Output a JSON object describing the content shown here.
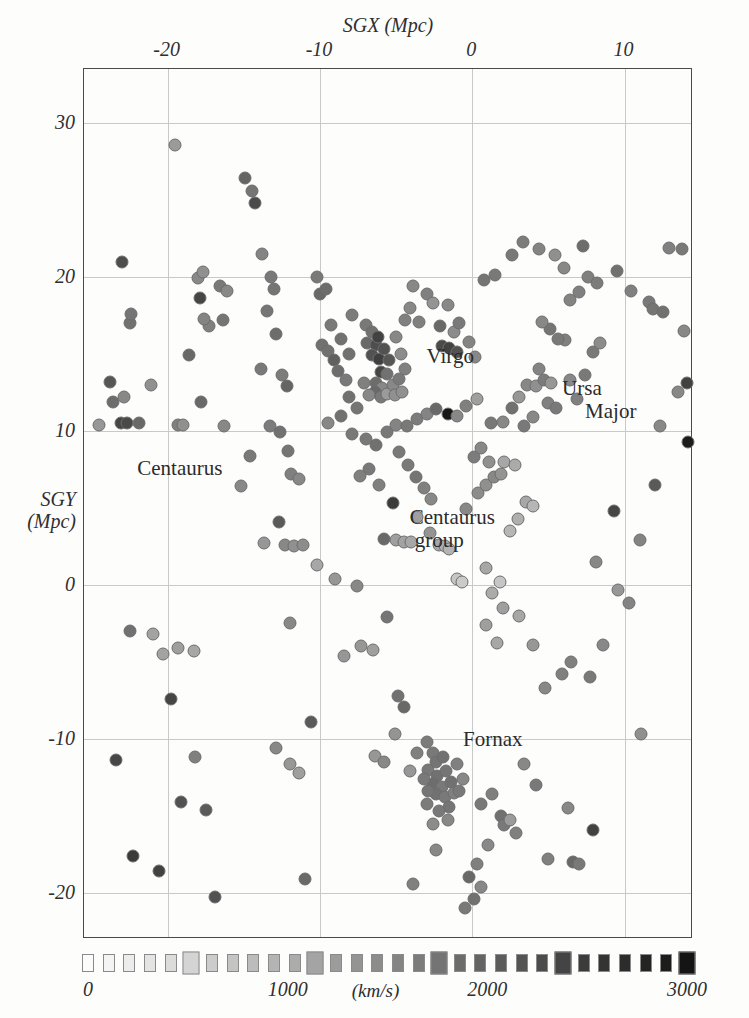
{
  "figure": {
    "caption_none": "",
    "background": "#fdfdfc"
  },
  "chart_data": {
    "type": "scatter",
    "title": "",
    "xlabel": "SGX (Mpc)",
    "ylabel_line1": "SGY",
    "ylabel_line2": "(Mpc)",
    "xlim": [
      -25.5,
      14.5
    ],
    "ylim": [
      -23.0,
      33.5
    ],
    "xticks": [
      -20,
      -10,
      0,
      10
    ],
    "xticklabels": [
      "-20",
      "-10",
      "0",
      "10"
    ],
    "yticks": [
      30,
      20,
      10,
      0,
      -10,
      -20
    ],
    "yticklabels": [
      "30",
      "20",
      "10",
      "0",
      "-10",
      "-20"
    ],
    "grid": true,
    "grid_color": "#c9c9c9",
    "marker": "circle",
    "marker_edge_color": "#6d6d6d",
    "colorbar": {
      "label": "(km/s)",
      "vmin": 0,
      "vmax": 3000,
      "ticks": [
        0,
        1000,
        2000,
        3000
      ],
      "ticklabels": [
        "0",
        "1000",
        "2000",
        "3000"
      ],
      "n_swatches": 30,
      "swatch_shape": "square",
      "low_color": "#ffffff",
      "high_color": "#1a1a1a",
      "position": "below-axes"
    },
    "annotations": [
      {
        "text": "Virgo",
        "x": -3.0,
        "y": 15.6,
        "lines": [
          "Virgo"
        ]
      },
      {
        "text": "Ursa Major",
        "x": 5.9,
        "y": 13.5,
        "lines": [
          "Ursa",
          "Major"
        ]
      },
      {
        "text": "Centaurus",
        "x": -22.0,
        "y": 8.3,
        "lines": [
          "Centaurus"
        ]
      },
      {
        "text": "Centaurus group",
        "x": -4.1,
        "y": 5.1,
        "lines": [
          "Centaurus",
          "group"
        ]
      },
      {
        "text": "Fornax",
        "x": -0.6,
        "y": -9.3,
        "lines": [
          "Fornax"
        ]
      }
    ],
    "point_fields": [
      "sgx_mpc",
      "sgy_mpc",
      "velocity_kms"
    ],
    "points": [
      [
        -23.8,
        13.2,
        2150
      ],
      [
        -23.6,
        11.9,
        1850
      ],
      [
        -22.9,
        12.2,
        1500
      ],
      [
        -24.5,
        10.4,
        1300
      ],
      [
        -23.1,
        10.5,
        2350
      ],
      [
        -22.7,
        10.5,
        2300
      ],
      [
        -21.9,
        10.5,
        1900
      ],
      [
        -22.5,
        17.0,
        1800
      ],
      [
        -23.0,
        21.0,
        2250
      ],
      [
        -21.1,
        13.0,
        1400
      ],
      [
        -22.4,
        17.6,
        1750
      ],
      [
        -19.5,
        28.6,
        1250
      ],
      [
        -22.5,
        -3.0,
        1800
      ],
      [
        -21.0,
        -3.2,
        1150
      ],
      [
        -23.4,
        -11.4,
        2350
      ],
      [
        -22.3,
        -17.6,
        2500
      ],
      [
        -20.6,
        -18.6,
        2400
      ],
      [
        -19.8,
        -7.4,
        2350
      ],
      [
        -19.3,
        10.4,
        1600
      ],
      [
        -18.0,
        19.9,
        1500
      ],
      [
        -17.7,
        20.3,
        1400
      ],
      [
        -17.9,
        18.6,
        2350
      ],
      [
        -17.3,
        16.8,
        1600
      ],
      [
        -17.6,
        17.3,
        1550
      ],
      [
        -16.6,
        19.4,
        1700
      ],
      [
        -16.1,
        19.1,
        1500
      ],
      [
        -16.4,
        17.2,
        1750
      ],
      [
        -18.6,
        14.9,
        1900
      ],
      [
        -17.8,
        11.9,
        1900
      ],
      [
        -19.0,
        10.4,
        1400
      ],
      [
        -16.3,
        10.3,
        1500
      ],
      [
        -18.3,
        -4.3,
        1100
      ],
      [
        -19.3,
        -4.1,
        1200
      ],
      [
        -20.3,
        -4.5,
        1150
      ],
      [
        -18.2,
        -11.2,
        1600
      ],
      [
        -17.5,
        -14.6,
        2100
      ],
      [
        -19.1,
        -14.1,
        2200
      ],
      [
        -16.9,
        -20.3,
        2200
      ],
      [
        -14.9,
        26.4,
        1950
      ],
      [
        -14.5,
        25.6,
        1750
      ],
      [
        -14.3,
        24.8,
        2300
      ],
      [
        -13.8,
        21.5,
        1550
      ],
      [
        -13.2,
        20.0,
        1700
      ],
      [
        -13.0,
        19.2,
        1750
      ],
      [
        -13.5,
        17.8,
        1750
      ],
      [
        -12.9,
        16.3,
        1850
      ],
      [
        -13.9,
        14.0,
        1700
      ],
      [
        -12.5,
        13.6,
        1650
      ],
      [
        -12.2,
        12.9,
        1950
      ],
      [
        -13.3,
        10.3,
        1650
      ],
      [
        -12.6,
        9.9,
        1800
      ],
      [
        -12.1,
        8.7,
        1750
      ],
      [
        -11.9,
        7.2,
        1600
      ],
      [
        -11.4,
        6.9,
        1500
      ],
      [
        -12.7,
        4.1,
        2100
      ],
      [
        -12.3,
        2.6,
        1500
      ],
      [
        -11.7,
        2.5,
        1400
      ],
      [
        -11.1,
        2.6,
        1450
      ],
      [
        -12.9,
        -10.6,
        1500
      ],
      [
        -12.0,
        -11.6,
        1300
      ],
      [
        -11.4,
        -12.2,
        1200
      ],
      [
        -10.6,
        -8.9,
        2100
      ],
      [
        -11.0,
        -19.1,
        1900
      ],
      [
        -10.2,
        20.0,
        1700
      ],
      [
        -10.0,
        18.9,
        1900
      ],
      [
        -9.6,
        19.2,
        1850
      ],
      [
        -9.3,
        16.9,
        1700
      ],
      [
        -9.9,
        15.6,
        1800
      ],
      [
        -9.5,
        15.2,
        1800
      ],
      [
        -9.1,
        14.6,
        2000
      ],
      [
        -8.6,
        16.0,
        1800
      ],
      [
        -8.1,
        15.0,
        1800
      ],
      [
        -8.8,
        13.9,
        1850
      ],
      [
        -8.3,
        13.3,
        1700
      ],
      [
        -8.1,
        12.2,
        1800
      ],
      [
        -7.6,
        11.5,
        1750
      ],
      [
        -7.9,
        17.5,
        1650
      ],
      [
        -7.0,
        16.9,
        1700
      ],
      [
        -6.9,
        15.7,
        1900
      ],
      [
        -6.6,
        16.4,
        1800
      ],
      [
        -6.3,
        15.6,
        2250
      ],
      [
        -6.2,
        16.1,
        2400
      ],
      [
        -6.6,
        14.9,
        2200
      ],
      [
        -6.1,
        14.7,
        2450
      ],
      [
        -5.8,
        15.3,
        2200
      ],
      [
        -5.5,
        14.6,
        2150
      ],
      [
        -6.0,
        13.8,
        2350
      ],
      [
        -5.6,
        13.7,
        1800
      ],
      [
        -6.3,
        13.1,
        1850
      ],
      [
        -5.9,
        12.8,
        1500
      ],
      [
        -6.4,
        12.5,
        1900
      ],
      [
        -6.0,
        12.2,
        1700
      ],
      [
        -5.6,
        12.4,
        1250
      ],
      [
        -5.2,
        13.0,
        1500
      ],
      [
        -4.8,
        13.4,
        1700
      ],
      [
        -5.1,
        12.3,
        1400
      ],
      [
        -4.6,
        12.5,
        1400
      ],
      [
        -6.8,
        12.3,
        1500
      ],
      [
        -7.1,
        13.1,
        1600
      ],
      [
        -4.4,
        14.0,
        1600
      ],
      [
        -4.7,
        15.0,
        1450
      ],
      [
        -5.0,
        16.1,
        1500
      ],
      [
        -4.4,
        17.2,
        1600
      ],
      [
        -4.1,
        18.0,
        1500
      ],
      [
        -3.9,
        19.4,
        1500
      ],
      [
        -3.5,
        17.1,
        1600
      ],
      [
        -3.0,
        18.9,
        1600
      ],
      [
        -2.6,
        18.3,
        1350
      ],
      [
        -2.1,
        16.8,
        1900
      ],
      [
        -1.6,
        18.2,
        1500
      ],
      [
        -1.2,
        16.4,
        1450
      ],
      [
        -2.0,
        15.5,
        2300
      ],
      [
        -1.5,
        15.4,
        2400
      ],
      [
        -1.0,
        15.1,
        2200
      ],
      [
        -0.9,
        17.0,
        1700
      ],
      [
        -0.2,
        15.8,
        1550
      ],
      [
        0.2,
        14.8,
        1500
      ],
      [
        -8.6,
        11.0,
        1800
      ],
      [
        -9.5,
        10.5,
        1500
      ],
      [
        -7.9,
        9.8,
        1700
      ],
      [
        -7.0,
        9.5,
        1700
      ],
      [
        -6.3,
        9.1,
        1800
      ],
      [
        -5.6,
        9.9,
        1700
      ],
      [
        -5.0,
        10.4,
        1550
      ],
      [
        -4.3,
        10.3,
        1700
      ],
      [
        -3.6,
        10.8,
        1650
      ],
      [
        -3.0,
        11.1,
        1550
      ],
      [
        -2.4,
        11.4,
        1900
      ],
      [
        -1.6,
        11.1,
        2950
      ],
      [
        -1.0,
        11.0,
        1500
      ],
      [
        -0.4,
        11.6,
        1600
      ],
      [
        0.3,
        12.1,
        1200
      ],
      [
        -4.8,
        8.6,
        1700
      ],
      [
        -4.2,
        7.8,
        1700
      ],
      [
        -3.7,
        7.0,
        1750
      ],
      [
        -3.2,
        6.3,
        1600
      ],
      [
        -2.7,
        5.6,
        1500
      ],
      [
        -3.6,
        4.4,
        1200
      ],
      [
        -2.8,
        3.4,
        1350
      ],
      [
        -2.2,
        2.6,
        1100
      ],
      [
        -1.8,
        2.5,
        1000
      ],
      [
        -1.5,
        2.3,
        950
      ],
      [
        -1.0,
        0.4,
        700
      ],
      [
        -0.7,
        0.2,
        650
      ],
      [
        -5.2,
        5.3,
        2500
      ],
      [
        -6.1,
        6.5,
        1600
      ],
      [
        -6.8,
        7.5,
        1700
      ],
      [
        -7.4,
        7.1,
        1600
      ],
      [
        -5.8,
        3.0,
        1900
      ],
      [
        -5.0,
        2.9,
        1200
      ],
      [
        -4.5,
        2.8,
        1150
      ],
      [
        -4.0,
        2.8,
        1100
      ],
      [
        -0.4,
        4.9,
        1500
      ],
      [
        0.4,
        6.0,
        1450
      ],
      [
        0.9,
        6.5,
        1400
      ],
      [
        1.4,
        7.0,
        1500
      ],
      [
        1.9,
        7.2,
        1350
      ],
      [
        0.1,
        8.3,
        1650
      ],
      [
        0.6,
        8.9,
        1500
      ],
      [
        1.1,
        8.0,
        1400
      ],
      [
        2.1,
        8.0,
        1100
      ],
      [
        2.8,
        7.8,
        1050
      ],
      [
        0.9,
        1.1,
        1100
      ],
      [
        1.8,
        0.2,
        700
      ],
      [
        2.5,
        3.5,
        900
      ],
      [
        3.0,
        4.3,
        1000
      ],
      [
        3.5,
        5.4,
        1100
      ],
      [
        4.0,
        5.1,
        900
      ],
      [
        1.2,
        10.5,
        1700
      ],
      [
        2.0,
        10.6,
        1500
      ],
      [
        2.6,
        11.5,
        1800
      ],
      [
        3.1,
        12.2,
        1300
      ],
      [
        3.6,
        13.0,
        1500
      ],
      [
        4.2,
        12.9,
        1400
      ],
      [
        4.7,
        13.3,
        1650
      ],
      [
        5.2,
        13.1,
        1300
      ],
      [
        4.4,
        14.0,
        1550
      ],
      [
        5.0,
        11.8,
        1600
      ],
      [
        5.5,
        11.5,
        1700
      ],
      [
        4.0,
        10.9,
        1500
      ],
      [
        3.4,
        10.3,
        1700
      ],
      [
        6.4,
        13.3,
        1500
      ],
      [
        6.9,
        12.1,
        1600
      ],
      [
        7.4,
        13.6,
        1700
      ],
      [
        7.9,
        15.1,
        1700
      ],
      [
        8.4,
        15.7,
        1450
      ],
      [
        6.1,
        15.9,
        1600
      ],
      [
        5.6,
        16.0,
        1700
      ],
      [
        5.1,
        16.6,
        1750
      ],
      [
        4.6,
        17.1,
        1500
      ],
      [
        6.4,
        18.5,
        1550
      ],
      [
        7.0,
        19.0,
        1600
      ],
      [
        7.6,
        20.0,
        1600
      ],
      [
        8.2,
        19.6,
        1650
      ],
      [
        6.0,
        20.6,
        1500
      ],
      [
        5.4,
        21.4,
        1400
      ],
      [
        4.4,
        21.8,
        1550
      ],
      [
        3.3,
        22.3,
        1650
      ],
      [
        2.6,
        21.4,
        1700
      ],
      [
        1.5,
        20.1,
        1700
      ],
      [
        0.8,
        19.8,
        1750
      ],
      [
        7.3,
        22.0,
        1850
      ],
      [
        9.5,
        20.4,
        1800
      ],
      [
        10.4,
        19.1,
        1600
      ],
      [
        11.6,
        18.4,
        1700
      ],
      [
        11.9,
        17.9,
        1750
      ],
      [
        12.5,
        17.7,
        1800
      ],
      [
        12.9,
        21.9,
        1600
      ],
      [
        13.8,
        21.8,
        1700
      ],
      [
        13.9,
        16.5,
        1500
      ],
      [
        13.5,
        12.5,
        1500
      ],
      [
        14.1,
        13.1,
        2400
      ],
      [
        14.2,
        9.3,
        2900
      ],
      [
        12.3,
        10.3,
        1500
      ],
      [
        12.0,
        6.5,
        2100
      ],
      [
        11.0,
        2.9,
        1550
      ],
      [
        10.3,
        -1.2,
        1550
      ],
      [
        9.6,
        -0.3,
        1300
      ],
      [
        11.1,
        -9.7,
        1400
      ],
      [
        8.6,
        -3.9,
        1500
      ],
      [
        7.7,
        -6.0,
        1700
      ],
      [
        6.5,
        -5.0,
        1600
      ],
      [
        5.9,
        -5.8,
        1600
      ],
      [
        4.8,
        -6.7,
        1500
      ],
      [
        4.0,
        -3.9,
        1300
      ],
      [
        3.1,
        -2.0,
        1100
      ],
      [
        2.0,
        -1.5,
        1200
      ],
      [
        1.3,
        -0.5,
        1050
      ],
      [
        -6.5,
        -4.2,
        1200
      ],
      [
        -7.3,
        -4.0,
        1300
      ],
      [
        -8.4,
        -4.6,
        1300
      ],
      [
        -5.6,
        -2.1,
        1750
      ],
      [
        -6.4,
        -11.1,
        1300
      ],
      [
        -5.8,
        -11.5,
        1500
      ],
      [
        -5.1,
        -9.7,
        1350
      ],
      [
        -4.5,
        -7.9,
        1900
      ],
      [
        -4.9,
        -7.2,
        1800
      ],
      [
        -3.6,
        -10.9,
        1600
      ],
      [
        -4.1,
        -12.1,
        1300
      ],
      [
        -3.0,
        -10.2,
        1650
      ],
      [
        -2.6,
        -10.9,
        1700
      ],
      [
        -2.4,
        -11.5,
        1750
      ],
      [
        -1.9,
        -11.2,
        1800
      ],
      [
        -2.9,
        -12.0,
        1700
      ],
      [
        -2.3,
        -12.4,
        1800
      ],
      [
        -1.7,
        -12.1,
        1750
      ],
      [
        -2.6,
        -12.9,
        1850
      ],
      [
        -2.0,
        -13.1,
        1700
      ],
      [
        -1.4,
        -12.8,
        1800
      ],
      [
        -2.4,
        -13.6,
        1800
      ],
      [
        -1.8,
        -13.8,
        1700
      ],
      [
        -1.2,
        -13.5,
        1600
      ],
      [
        -2.9,
        -13.4,
        1750
      ],
      [
        -3.2,
        -12.6,
        1700
      ],
      [
        -1.5,
        -14.4,
        1750
      ],
      [
        -2.2,
        -14.7,
        1700
      ],
      [
        -3.0,
        -14.2,
        1650
      ],
      [
        -1.0,
        -11.6,
        1600
      ],
      [
        -0.6,
        -12.6,
        1500
      ],
      [
        -0.9,
        -13.4,
        1700
      ],
      [
        -1.6,
        -15.3,
        1500
      ],
      [
        -2.6,
        -15.5,
        1450
      ],
      [
        0.6,
        -14.2,
        1700
      ],
      [
        1.3,
        -13.6,
        1600
      ],
      [
        1.9,
        -15.0,
        1800
      ],
      [
        2.1,
        -15.6,
        1700
      ],
      [
        2.5,
        -15.3,
        1250
      ],
      [
        2.9,
        -16.1,
        1600
      ],
      [
        1.0,
        -16.9,
        1500
      ],
      [
        0.3,
        -18.1,
        1600
      ],
      [
        -0.5,
        -21.0,
        1700
      ],
      [
        0.1,
        -20.4,
        1800
      ],
      [
        0.6,
        -19.6,
        1500
      ],
      [
        -0.2,
        -19.0,
        1900
      ],
      [
        -3.9,
        -19.4,
        1600
      ],
      [
        -2.4,
        -17.2,
        1500
      ],
      [
        5.0,
        -17.8,
        1600
      ],
      [
        6.6,
        -18.0,
        1900
      ],
      [
        7.0,
        -18.1,
        1700
      ],
      [
        7.9,
        -15.9,
        2400
      ],
      [
        6.3,
        -14.5,
        1500
      ],
      [
        4.2,
        -13.0,
        1700
      ],
      [
        3.4,
        -11.6,
        1500
      ],
      [
        -7.6,
        -0.1,
        1500
      ],
      [
        -9.0,
        0.4,
        1300
      ],
      [
        -10.2,
        1.3,
        1100
      ],
      [
        -13.7,
        2.7,
        1300
      ],
      [
        0.9,
        -2.6,
        1200
      ],
      [
        1.6,
        -3.8,
        1100
      ],
      [
        9.3,
        4.8,
        2350
      ],
      [
        8.1,
        1.5,
        1500
      ],
      [
        -14.6,
        8.4,
        1700
      ],
      [
        -15.2,
        6.4,
        1500
      ],
      [
        -12.0,
        -2.5,
        1500
      ]
    ]
  }
}
